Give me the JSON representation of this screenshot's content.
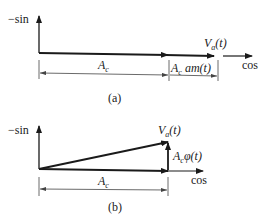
{
  "diagram_a": {
    "y_axis_label": "−sin",
    "x_axis_label": "cos",
    "vector_label": "V_a(t)",
    "vector_label_main": "V",
    "vector_label_sub": "a",
    "vector_label_arg": "(t)",
    "dim1_label_main": "A",
    "dim1_label_sub": "c",
    "dim2_label_main": "A",
    "dim2_label_sub": "c",
    "dim2_label_rest": " am(t)",
    "caption": "(a)"
  },
  "diagram_b": {
    "y_axis_label": "−sin",
    "x_axis_label": "cos",
    "vector_label_main": "V",
    "vector_label_sub": "a",
    "vector_label_arg": "(t)",
    "quad_label_main": "A",
    "quad_label_sub": "c",
    "quad_label_rest": "φ(t)",
    "dim_label_main": "A",
    "dim_label_sub": "c",
    "caption": "(b)"
  },
  "colors": {
    "line": "#1a1a1a",
    "dim": "#444444"
  }
}
